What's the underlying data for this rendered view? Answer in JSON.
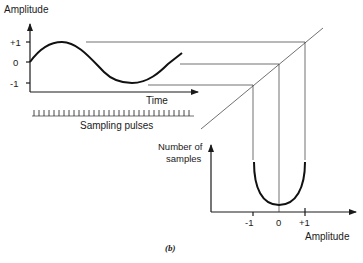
{
  "diagram": {
    "caption": "(b)",
    "time_plot": {
      "y_axis_label": "Amplitude",
      "x_axis_label": "Time",
      "y_ticks": [
        "+1",
        "0",
        "-1"
      ],
      "signal": "sine wave"
    },
    "sampling": {
      "label": "Sampling pulses",
      "pulse_count": 32
    },
    "histogram_plot": {
      "y_axis_label_line1": "Number of",
      "y_axis_label_line2": "samples",
      "x_axis_label": "Amplitude",
      "x_ticks": [
        "-1",
        "0",
        "+1"
      ],
      "shape": "U-shaped amplitude distribution"
    },
    "transfer": {
      "description": "45-degree mapping line projecting amplitude levels +1, 0, -1 down to the histogram axis"
    }
  }
}
